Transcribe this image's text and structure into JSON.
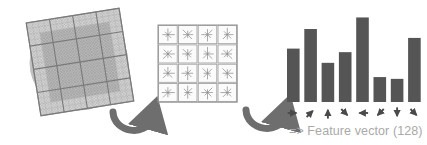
{
  "figure": {
    "caption_text": "=> Feature vector (128)",
    "colors": {
      "bar_fill": "#555555",
      "grid_line": "#8c8c8c",
      "patch_fill": "#b9b9b9",
      "gaussian_circle": "#c9c9c9",
      "arrow_dark": "#4a4a4a",
      "curved_arrow": "#6e6e6e",
      "label_text": "#a9a9a9",
      "cell_border": "#9a9a9a",
      "star_stroke": "#8f8f8f",
      "background": "#ffffff"
    }
  },
  "panels": {
    "image_gradients": {
      "name": "Image gradients",
      "rotation_deg": -9,
      "blocks": 4,
      "cells_per_block": 4,
      "window_shape": "circle"
    },
    "keypoint_descriptor": {
      "name": "Keypoint descriptor",
      "rows": 4,
      "cols": 4,
      "bins_per_cell": 8,
      "cells": [
        {
          "row": 0,
          "col": 0,
          "bin_lengths": [
            9,
            6,
            8,
            5,
            7,
            4,
            8,
            6
          ]
        },
        {
          "row": 0,
          "col": 1,
          "bin_lengths": [
            7,
            8,
            5,
            9,
            6,
            7,
            4,
            8
          ]
        },
        {
          "row": 0,
          "col": 2,
          "bin_lengths": [
            6,
            9,
            7,
            4,
            8,
            5,
            9,
            6
          ]
        },
        {
          "row": 0,
          "col": 3,
          "bin_lengths": [
            8,
            5,
            9,
            6,
            4,
            8,
            6,
            7
          ]
        },
        {
          "row": 1,
          "col": 0,
          "bin_lengths": [
            9,
            7,
            4,
            8,
            6,
            9,
            5,
            7
          ]
        },
        {
          "row": 1,
          "col": 1,
          "bin_lengths": [
            5,
            8,
            6,
            9,
            7,
            4,
            8,
            6
          ]
        },
        {
          "row": 1,
          "col": 2,
          "bin_lengths": [
            8,
            4,
            9,
            6,
            5,
            8,
            7,
            9
          ]
        },
        {
          "row": 1,
          "col": 3,
          "bin_lengths": [
            6,
            9,
            5,
            7,
            8,
            6,
            4,
            9
          ]
        },
        {
          "row": 2,
          "col": 0,
          "bin_lengths": [
            9,
            5,
            8,
            7,
            6,
            9,
            4,
            8
          ]
        },
        {
          "row": 2,
          "col": 1,
          "bin_lengths": [
            7,
            6,
            9,
            4,
            8,
            5,
            9,
            7
          ]
        },
        {
          "row": 2,
          "col": 2,
          "bin_lengths": [
            4,
            8,
            6,
            9,
            5,
            7,
            8,
            6
          ]
        },
        {
          "row": 2,
          "col": 3,
          "bin_lengths": [
            8,
            7,
            5,
            9,
            6,
            4,
            7,
            9
          ]
        },
        {
          "row": 3,
          "col": 0,
          "bin_lengths": [
            9,
            6,
            7,
            5,
            8,
            9,
            6,
            4
          ]
        },
        {
          "row": 3,
          "col": 1,
          "bin_lengths": [
            6,
            8,
            9,
            7,
            4,
            6,
            8,
            5
          ]
        },
        {
          "row": 3,
          "col": 2,
          "bin_lengths": [
            7,
            9,
            4,
            6,
            8,
            5,
            9,
            7
          ]
        },
        {
          "row": 3,
          "col": 3,
          "bin_lengths": [
            5,
            7,
            8,
            6,
            9,
            8,
            4,
            7
          ]
        }
      ]
    }
  },
  "chart_data": {
    "type": "bar",
    "xlabel": "",
    "ylabel": "",
    "grid": false,
    "legend": "none",
    "ylim": [
      0,
      100
    ],
    "categories": [
      "0°",
      "45°",
      "90°",
      "135°",
      "180°",
      "225°",
      "270°",
      "315°"
    ],
    "tick_labels": [
      "→",
      "↗",
      "↑",
      "↘",
      "←",
      "↙",
      "↓",
      "↘"
    ],
    "bin_directions": [
      "right",
      "up-right",
      "up",
      "down-right",
      "left",
      "down-left",
      "down",
      "down-right"
    ],
    "bin_angles_deg": [
      0,
      45,
      90,
      315,
      180,
      225,
      270,
      315
    ],
    "values": [
      60,
      82,
      44,
      56,
      95,
      28,
      26,
      72
    ],
    "annotations": [
      "=> Feature vector (128)"
    ]
  },
  "flow": {
    "arrow_1": {
      "label": "gradients-to-descriptor",
      "shape": "u-curve"
    },
    "arrow_2": {
      "label": "descriptor-to-histogram",
      "shape": "u-curve"
    }
  }
}
